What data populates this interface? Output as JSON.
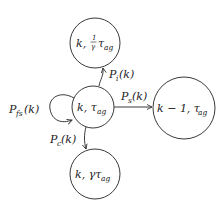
{
  "diagram": {
    "type": "state-transition",
    "nodes": [
      {
        "id": "center",
        "label_main": "k, τ",
        "label_sub": "ag",
        "cx": 93,
        "cy": 107,
        "r": 21
      },
      {
        "id": "top",
        "label_main": "k, ",
        "label_frac_num": "1",
        "label_frac_den": "γ",
        "label_tau": "τ",
        "label_sub": "ag",
        "cx": 95,
        "cy": 43,
        "r": 25
      },
      {
        "id": "right",
        "label_main": "k − 1, τ",
        "label_sub": "ag",
        "cx": 184,
        "cy": 108,
        "r": 31
      },
      {
        "id": "bottom",
        "label_main": "k, γτ",
        "label_sub": "ag",
        "cx": 95,
        "cy": 174,
        "r": 25
      }
    ],
    "edges": [
      {
        "id": "self-loop",
        "from": "center",
        "to": "center",
        "label_P": "P",
        "label_sub": "fs",
        "label_arg": "(k)"
      },
      {
        "id": "to-top",
        "from": "center",
        "to": "top",
        "label_P": "P",
        "label_sub": "i",
        "label_arg": "(k)"
      },
      {
        "id": "to-right",
        "from": "center",
        "to": "right",
        "label_P": "P",
        "label_sub": "s",
        "label_arg": "(k)"
      },
      {
        "id": "to-bottom",
        "from": "center",
        "to": "bottom",
        "label_P": "P",
        "label_sub": "c",
        "label_arg": "(k)"
      }
    ]
  }
}
